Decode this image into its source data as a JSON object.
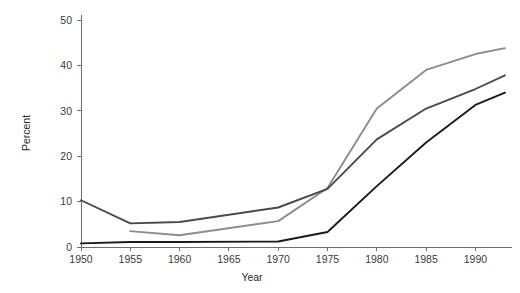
{
  "chart_data": {
    "type": "line",
    "title": "",
    "subtitle": "",
    "xlabel": "Year",
    "ylabel": "Percent",
    "xlim": [
      1948,
      1994
    ],
    "ylim": [
      0,
      52
    ],
    "grid": false,
    "legend": "none",
    "x_ticks": [
      1950,
      1955,
      1960,
      1965,
      1970,
      1975,
      1980,
      1985,
      1990
    ],
    "x_tick_labels": [
      "1950",
      "1955",
      "1960",
      "1965",
      "1970",
      "1975",
      "1980",
      "1985",
      "1990"
    ],
    "y_ticks": [
      0,
      10,
      20,
      30,
      40,
      50
    ],
    "y_tick_labels": [
      "0",
      "10",
      "20",
      "30",
      "40",
      "50"
    ],
    "series": [
      {
        "name": "series-light-gray",
        "color": "#8c8c8c",
        "x": [
          1955,
          1960,
          1970,
          1975,
          1980,
          1985,
          1990,
          1993
        ],
        "values": [
          3.5,
          2.6,
          5.7,
          13.0,
          30.5,
          39.0,
          42.5,
          43.8
        ]
      },
      {
        "name": "series-dark-gray",
        "color": "#4a4a4a",
        "x": [
          1950,
          1955,
          1960,
          1970,
          1975,
          1980,
          1985,
          1990,
          1993
        ],
        "values": [
          10.3,
          5.2,
          5.5,
          8.7,
          12.8,
          23.7,
          30.5,
          34.8,
          37.8
        ]
      },
      {
        "name": "series-black",
        "color": "#1a1a1a",
        "x": [
          1950,
          1955,
          1960,
          1970,
          1975,
          1980,
          1985,
          1990,
          1993
        ],
        "values": [
          0.8,
          1.1,
          1.1,
          1.2,
          3.3,
          13.4,
          23.0,
          31.3,
          34.0
        ]
      }
    ]
  }
}
